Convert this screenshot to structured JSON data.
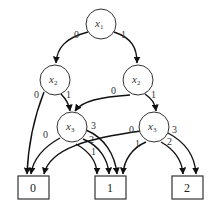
{
  "diagram": {
    "type": "multi-valued decision diagram",
    "nodes": [
      {
        "id": "x1",
        "var": "x",
        "sub": "1",
        "cx": 101,
        "cy": 24
      },
      {
        "id": "x2L",
        "var": "x",
        "sub": "2",
        "cx": 55,
        "cy": 80
      },
      {
        "id": "x2R",
        "var": "x",
        "sub": "2",
        "cx": 138,
        "cy": 80
      },
      {
        "id": "x3L",
        "var": "x",
        "sub": "3",
        "cx": 72,
        "cy": 128
      },
      {
        "id": "x3R",
        "var": "x",
        "sub": "3",
        "cx": 154,
        "cy": 128
      }
    ],
    "terminals": [
      {
        "id": "t0",
        "label": "0"
      },
      {
        "id": "t1",
        "label": "1"
      },
      {
        "id": "t2",
        "label": "2"
      }
    ],
    "edges": [
      {
        "from": "x1",
        "to": "x2L",
        "label": "0"
      },
      {
        "from": "x1",
        "to": "x2R",
        "label": "1"
      },
      {
        "from": "x2L",
        "to": "t0",
        "label": "0"
      },
      {
        "from": "x2L",
        "to": "x3L",
        "label": "1"
      },
      {
        "from": "x2R",
        "to": "x3L",
        "label": "0"
      },
      {
        "from": "x2R",
        "to": "x3R",
        "label": "1"
      },
      {
        "from": "x3L",
        "to": "t0",
        "label": "0"
      },
      {
        "from": "x3L",
        "to": "t1",
        "label": "1"
      },
      {
        "from": "x3L",
        "to": "t1",
        "label": "2"
      },
      {
        "from": "x3L",
        "to": "t1",
        "label": "3"
      },
      {
        "from": "x3R",
        "to": "t0",
        "label": "0"
      },
      {
        "from": "x3R",
        "to": "t1",
        "label": "1"
      },
      {
        "from": "x3R",
        "to": "t2",
        "label": "2"
      },
      {
        "from": "x3R",
        "to": "t2",
        "label": "3"
      }
    ],
    "labels": {
      "x1_var": "x",
      "x1_sub": "1",
      "x2L_var": "x",
      "x2L_sub": "2",
      "x2R_var": "x",
      "x2R_sub": "2",
      "x3L_var": "x",
      "x3L_sub": "3",
      "x3R_var": "x",
      "x3R_sub": "3",
      "e_x1_0": "0",
      "e_x1_1": "1",
      "e_x2L_0": "0",
      "e_x2L_1": "1",
      "e_x2R_0": "0",
      "e_x2R_1": "1",
      "e_x3L_0": "0",
      "e_x3L_1": "1",
      "e_x3L_2": "2",
      "e_x3L_3": "3",
      "e_x3R_0": "0",
      "e_x3R_1": "1",
      "e_x3R_2": "2",
      "e_x3R_3": "3",
      "t0": "0",
      "t1": "1",
      "t2": "2"
    }
  }
}
